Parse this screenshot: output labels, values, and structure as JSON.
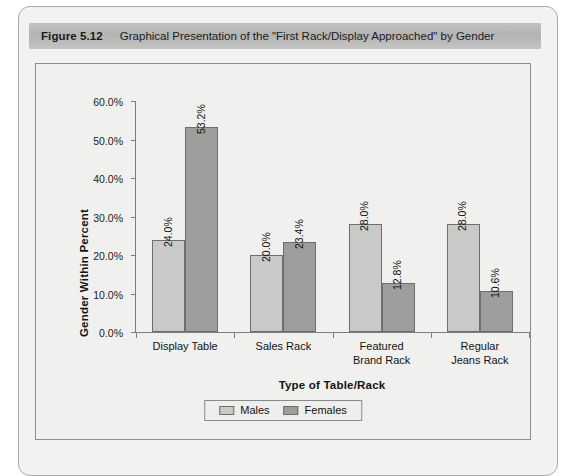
{
  "figure": {
    "number_label": "Figure 5.12",
    "caption": "Graphical Presentation of the \"First Rack/Display Approached\" by Gender"
  },
  "chart_data": {
    "type": "bar",
    "title": "",
    "xlabel": "Type of Table/Rack",
    "ylabel": "Gender Within Percent",
    "categories": [
      "Display Table",
      "Sales Rack",
      "Featured Brand Rack",
      "Regular Jeans Rack"
    ],
    "category_lines": [
      [
        "Display Table"
      ],
      [
        "Sales Rack"
      ],
      [
        "Featured",
        "Brand Rack"
      ],
      [
        "Regular",
        "Jeans Rack"
      ]
    ],
    "series": [
      {
        "name": "Males",
        "color": "#c9c9c7",
        "values": [
          24.0,
          20.0,
          28.0,
          28.0
        ],
        "labels": [
          "24.0%",
          "20.0%",
          "28.0%",
          "28.0%"
        ]
      },
      {
        "name": "Females",
        "color": "#9d9d9b",
        "values": [
          53.2,
          23.4,
          12.8,
          10.6
        ],
        "labels": [
          "53.2%",
          "23.4%",
          "12.8%",
          "10.6%"
        ]
      }
    ],
    "ylim": [
      0,
      60
    ],
    "ytick_values": [
      0,
      10,
      20,
      30,
      40,
      50,
      60
    ],
    "ytick_labels": [
      "0.0%",
      "10.0%",
      "20.0%",
      "30.0%",
      "40.0%",
      "50.0%",
      "60.0%"
    ],
    "grid": false,
    "legend_position": "bottom"
  }
}
